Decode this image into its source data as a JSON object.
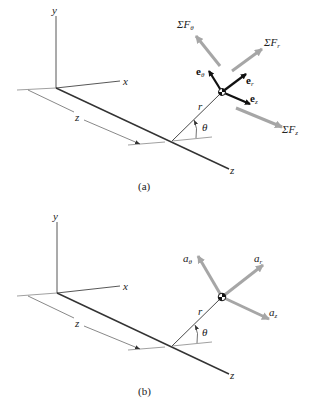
{
  "panels": [
    {
      "id": "a",
      "caption": "(a)",
      "axes": {
        "y": "y",
        "x": "x",
        "z": "z",
        "z_dim": "z"
      },
      "position": {
        "r": "r",
        "theta": "θ"
      },
      "unit_vectors": [
        {
          "base": "e",
          "sub": "θ"
        },
        {
          "base": "e",
          "sub": "r"
        },
        {
          "base": "e",
          "sub": "z"
        }
      ],
      "force_sums": [
        {
          "prefix": "ΣF",
          "sub": "θ"
        },
        {
          "prefix": "ΣF",
          "sub": "r"
        },
        {
          "prefix": "ΣF",
          "sub": "z"
        }
      ]
    },
    {
      "id": "b",
      "caption": "(b)",
      "axes": {
        "y": "y",
        "x": "x",
        "z": "z",
        "z_dim": "z"
      },
      "position": {
        "r": "r",
        "theta": "θ"
      },
      "accelerations": [
        {
          "base": "a",
          "sub": "θ"
        },
        {
          "base": "a",
          "sub": "r"
        },
        {
          "base": "a",
          "sub": "z"
        }
      ]
    }
  ],
  "colors": {
    "axis": "#333333",
    "unit_vector": "#111111",
    "resultant": "#a6a6a6"
  }
}
